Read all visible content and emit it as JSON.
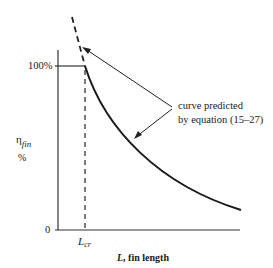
{
  "diagram": {
    "y_axis": {
      "symbol": "η",
      "symbol_subscript": "fin",
      "unit": "%",
      "tick_top": "100%",
      "tick_bottom": "0"
    },
    "x_axis": {
      "label_symbol": "L",
      "label_text": ", fin length",
      "marker_symbol": "L",
      "marker_subscript": "cr"
    },
    "annotation": {
      "line1": "curve predicted",
      "line2": "by equation (15–27)"
    },
    "colors": {
      "line": "#1a1a1a",
      "background": "#ffffff"
    }
  }
}
